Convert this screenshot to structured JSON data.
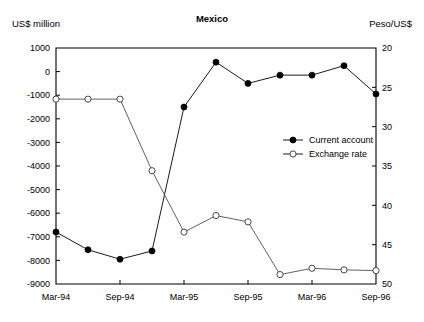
{
  "chart_data": {
    "type": "line",
    "title": "Mexico",
    "xlabel": "",
    "ylabel": "US$ million",
    "y2label": "Peso/US$",
    "grid": false,
    "legend_position": "center-right",
    "x_tick_labels": [
      "Mar-94",
      "Sep-94",
      "Mar-95",
      "Sep-95",
      "Mar-96",
      "Sep-96"
    ],
    "x_tick_indices": [
      0,
      2,
      4,
      6,
      8,
      10
    ],
    "x_points": 11,
    "ylim": [
      -9000,
      1000
    ],
    "y_tick_labels": [
      "1000",
      "0",
      "-1000",
      "-2000",
      "-3000",
      "-4000",
      "-5000",
      "-6000",
      "-7000",
      "-8000",
      "-9000"
    ],
    "y_tick_values": [
      1000,
      0,
      -1000,
      -2000,
      -3000,
      -4000,
      -5000,
      -6000,
      -7000,
      -8000,
      -9000
    ],
    "y2lim": [
      20,
      50
    ],
    "y2_inverted": true,
    "y2_tick_labels": [
      "20",
      "25",
      "30",
      "35",
      "40",
      "45",
      "50"
    ],
    "y2_tick_values": [
      20,
      25,
      30,
      35,
      40,
      45,
      50
    ],
    "series": [
      {
        "name": "Current account",
        "marker": "filled-circle",
        "axis": "left",
        "values": [
          -6800,
          -7550,
          -7950,
          -7600,
          -1500,
          400,
          -500,
          -150,
          -150,
          250,
          -950
        ]
      },
      {
        "name": "Exchange rate",
        "marker": "open-circle",
        "axis": "right",
        "values": [
          26.5,
          26.5,
          26.5,
          35.6,
          43.4,
          41.3,
          42.1,
          48.8,
          48.0,
          48.2,
          48.3
        ]
      }
    ]
  },
  "legend": {
    "items": [
      {
        "label": "Current account",
        "marker": "filled-circle"
      },
      {
        "label": "Exchange rate",
        "marker": "open-circle"
      }
    ]
  }
}
